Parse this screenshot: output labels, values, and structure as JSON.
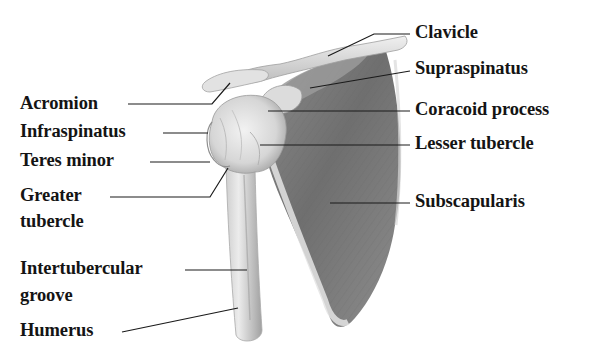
{
  "figure": {
    "colors": {
      "background": "#ffffff",
      "label_text": "#141414",
      "leader_line": "#1a1a1a",
      "bone_light": "#e6e6e6",
      "bone_mid": "#c4c4c4",
      "muscle_dark": "#7a7a7a",
      "muscle_mid": "#9c9c9c"
    },
    "labels_left": [
      {
        "id": "acromion",
        "text": "Acromion",
        "x": 20,
        "y": 93
      },
      {
        "id": "infraspinatus",
        "text": "Infraspinatus",
        "x": 20,
        "y": 121
      },
      {
        "id": "teres-minor",
        "text": "Teres minor",
        "x": 20,
        "y": 149
      },
      {
        "id": "greater-tubercle-1",
        "text": "Greater",
        "x": 20,
        "y": 185
      },
      {
        "id": "greater-tubercle-2",
        "text": "tubercle",
        "x": 20,
        "y": 211
      },
      {
        "id": "intertubercular-groove-1",
        "text": "Intertubercular",
        "x": 20,
        "y": 257
      },
      {
        "id": "intertubercular-groove-2",
        "text": "groove",
        "x": 20,
        "y": 284
      },
      {
        "id": "humerus",
        "text": "Humerus",
        "x": 20,
        "y": 317
      }
    ],
    "labels_right": [
      {
        "id": "clavicle",
        "text": "Clavicle",
        "x": 415,
        "y": 20
      },
      {
        "id": "supraspinatus",
        "text": "Supraspinatus",
        "x": 415,
        "y": 57
      },
      {
        "id": "coracoid-process",
        "text": "Coracoid process",
        "x": 415,
        "y": 98
      },
      {
        "id": "lesser-tubercle",
        "text": "Lesser tubercle",
        "x": 415,
        "y": 133
      },
      {
        "id": "subscapularis",
        "text": "Subscapularis",
        "x": 415,
        "y": 190
      }
    ]
  }
}
